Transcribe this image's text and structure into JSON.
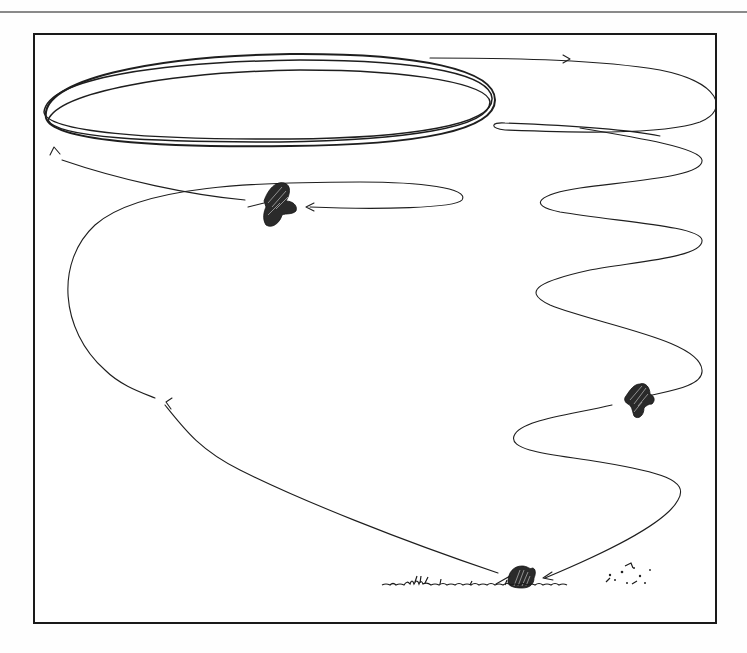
{
  "figure": {
    "type": "line illustration",
    "caption": "",
    "colors": {
      "ink": "#1e1e1e",
      "frame": "#1a1a1a",
      "background": "#ffffff",
      "top_rule": "#8a8a8a"
    },
    "elements": [
      {
        "name": "bird-on-ground",
        "description": "woodcock sitting in grass, bill pointing left",
        "x": 520,
        "y": 578
      },
      {
        "name": "bird-ascending",
        "description": "woodcock in flight on zigzag climb",
        "x": 640,
        "y": 398
      },
      {
        "name": "bird-descending",
        "description": "woodcock in flight, bill pointing left, after high circling",
        "x": 278,
        "y": 205
      },
      {
        "name": "high-orbit",
        "description": "repeated elliptical loops at top of flight",
        "x": 270,
        "y": 103
      },
      {
        "name": "ground-grass",
        "description": "grass tufts and scattered debris along ground line",
        "x": 500,
        "y": 585
      }
    ],
    "arrows": [
      {
        "location": "near landing bird, approach from right",
        "direction": "left"
      },
      {
        "location": "top path going right",
        "direction": "right"
      },
      {
        "location": "left side of upper ellipse",
        "direction": "up"
      },
      {
        "location": "approaching descending bird",
        "direction": "left"
      },
      {
        "location": "left descent line",
        "direction": "up-left"
      }
    ]
  }
}
